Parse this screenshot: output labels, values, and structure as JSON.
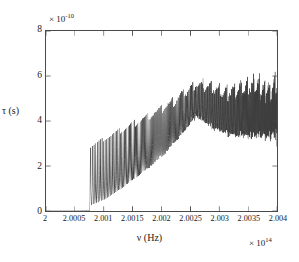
{
  "figure": {
    "name": "tau-versus-nu-resonance-plot",
    "background": "#ffffff",
    "line_color": "#3c3c3c"
  },
  "axes": {
    "y_multiplier_text": "× 10",
    "y_multiplier_exponent": "-10",
    "x_multiplier_text": "× 10",
    "x_multiplier_exponent": "14",
    "y_axis_title": "τ (s)",
    "x_axis_title": "ν (Hz)",
    "y_ticks": [
      "0",
      "2",
      "4",
      "6",
      "8"
    ],
    "x_ticks": [
      "2",
      "2.0005",
      "2.001",
      "2.0015",
      "2.002",
      "2.0025",
      "2.003",
      "2.0035",
      "2.004"
    ]
  },
  "chart_data": {
    "type": "line",
    "title": "",
    "xlabel": "ν (Hz)",
    "ylabel": "τ (s)",
    "x_scale_factor": 100000000000000.0,
    "y_scale_factor": 1e-10,
    "xlim": [
      2.0,
      2.004
    ],
    "ylim": [
      0,
      8
    ],
    "xticks": [
      2.0,
      2.0005,
      2.001,
      2.0015,
      2.002,
      2.0025,
      2.003,
      2.0035,
      2.004
    ],
    "yticks": [
      0,
      2,
      4,
      6,
      8
    ],
    "grid": false,
    "legend": false,
    "series": [
      {
        "name": "tau",
        "envelope_upper": {
          "x": [
            2.0,
            2.0007,
            2.00077,
            2.00085,
            2.001,
            2.0012,
            2.0015,
            2.0018,
            2.0021,
            2.0024,
            2.00255,
            2.0027,
            2.0029,
            2.0031,
            2.0033,
            2.0035,
            2.0037,
            2.0039,
            2.004
          ],
          "y": [
            0.02,
            0.05,
            2.9,
            3.05,
            3.3,
            3.6,
            4.05,
            4.45,
            4.9,
            5.45,
            5.75,
            5.8,
            5.7,
            5.6,
            5.65,
            5.95,
            6.0,
            5.85,
            6.1
          ]
        },
        "envelope_lower": {
          "x": [
            2.0,
            2.0007,
            2.00077,
            2.00085,
            2.001,
            2.0012,
            2.0015,
            2.0018,
            2.0021,
            2.0024,
            2.0026,
            2.0028,
            2.003,
            2.0032,
            2.0034,
            2.0036,
            2.0038,
            2.004
          ],
          "y": [
            0.0,
            0.0,
            0.02,
            0.05,
            0.2,
            0.5,
            1.05,
            1.65,
            2.35,
            3.3,
            4.0,
            3.55,
            3.25,
            3.05,
            2.95,
            2.9,
            2.88,
            2.9
          ]
        },
        "comb": {
          "onset_x": 2.00077,
          "spacing_start": 3.2e-05,
          "spacing_end": 6.5e-06,
          "note": "resonance spacing narrows monotonically toward higher frequency producing the dense fringe pattern on the right"
        }
      }
    ]
  }
}
